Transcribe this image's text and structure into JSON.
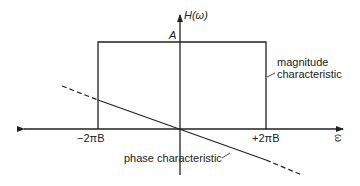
{
  "diagram": {
    "y_axis_label": "H(ω)",
    "x_axis_label": "ω",
    "amplitude_label": "A",
    "left_cutoff_label": "−2πB",
    "right_cutoff_label": "+2πB",
    "magnitude_label_line1": "magnitude",
    "magnitude_label_line2": "characteristic",
    "phase_label": "phase characteristic"
  },
  "colors": {
    "line": "#222222",
    "background": "#ffffff"
  }
}
